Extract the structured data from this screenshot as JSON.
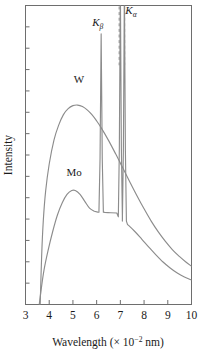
{
  "chart_data": {
    "type": "line",
    "title": "",
    "subtitle": "",
    "xlabel_parts": {
      "main": "Wavelength (× 10",
      "exponent": "−2",
      "tail": " nm)"
    },
    "xlabel": "Wavelength (× 10−2 nm)",
    "ylabel": "Intensity",
    "xlim": [
      3,
      10
    ],
    "ylim": [
      0,
      1
    ],
    "xticks": [
      3,
      4,
      5,
      6,
      7,
      8,
      9,
      10
    ],
    "xticklabels": [
      "3",
      "4",
      "5",
      "6",
      "7",
      "8",
      "9",
      "10"
    ],
    "yticks_count": 14,
    "yticklabels": [],
    "grid": false,
    "legend_position": "inline-annotations",
    "annotations": [
      {
        "id": "k-beta",
        "text_main": "K",
        "text_sub": "β",
        "x": 6.05,
        "y": 0.93
      },
      {
        "id": "k-alpha",
        "text_main": "K",
        "text_sub": "α",
        "x": 7.45,
        "y": 0.97
      },
      {
        "id": "w-label",
        "text_main": "W",
        "text_sub": "",
        "x": 5.25,
        "y": 0.74
      },
      {
        "id": "mo-label",
        "text_main": "Mo",
        "text_sub": "",
        "x": 5.05,
        "y": 0.43
      }
    ],
    "reference_lines": [
      {
        "id": "k-alpha-dash-left",
        "x": 6.95,
        "style": "dashed"
      },
      {
        "id": "k-alpha-dash-right",
        "x": 7.18,
        "style": "dashed"
      }
    ],
    "series": [
      {
        "name": "W",
        "label": "W",
        "color": "#8c8c8c",
        "cutoff_wavelength": 3.62,
        "peak_wavelength": 5.2,
        "peak_intensity": 0.67,
        "has_characteristic_peaks": false,
        "points": [
          [
            3.62,
            0.0
          ],
          [
            3.68,
            0.16
          ],
          [
            3.75,
            0.28
          ],
          [
            3.85,
            0.38
          ],
          [
            4.0,
            0.47
          ],
          [
            4.2,
            0.55
          ],
          [
            4.4,
            0.6
          ],
          [
            4.6,
            0.635
          ],
          [
            4.8,
            0.655
          ],
          [
            5.0,
            0.665
          ],
          [
            5.2,
            0.667
          ],
          [
            5.4,
            0.662
          ],
          [
            5.6,
            0.651
          ],
          [
            5.8,
            0.635
          ],
          [
            6.0,
            0.614
          ],
          [
            6.2,
            0.59
          ],
          [
            6.5,
            0.549
          ],
          [
            6.8,
            0.504
          ],
          [
            7.1,
            0.457
          ],
          [
            7.4,
            0.41
          ],
          [
            7.7,
            0.364
          ],
          [
            8.0,
            0.32
          ],
          [
            8.3,
            0.279
          ],
          [
            8.6,
            0.243
          ],
          [
            8.9,
            0.211
          ],
          [
            9.2,
            0.183
          ],
          [
            9.5,
            0.16
          ],
          [
            9.75,
            0.143
          ],
          [
            10.0,
            0.128
          ]
        ]
      },
      {
        "name": "Mo",
        "label": "Mo",
        "color": "#8c8c8c",
        "cutoff_wavelength": 3.58,
        "broad_hump_wavelength": 5.0,
        "broad_hump_intensity": 0.385,
        "has_characteristic_peaks": true,
        "characteristic_peaks": [
          {
            "name": "K-beta",
            "wavelength": 6.19,
            "intensity": 0.905,
            "halfwidth": 0.055
          },
          {
            "name": "K-alpha-1",
            "wavelength": 7.0,
            "intensity": 1.06,
            "halfwidth": 0.05
          },
          {
            "name": "K-alpha-2",
            "wavelength": 7.17,
            "intensity": 1.06,
            "halfwidth": 0.05
          }
        ],
        "points": [
          [
            3.58,
            0.0
          ],
          [
            3.66,
            0.05
          ],
          [
            3.78,
            0.115
          ],
          [
            3.95,
            0.18
          ],
          [
            4.15,
            0.245
          ],
          [
            4.35,
            0.3
          ],
          [
            4.55,
            0.34
          ],
          [
            4.75,
            0.368
          ],
          [
            4.95,
            0.381
          ],
          [
            5.1,
            0.381
          ],
          [
            5.3,
            0.368
          ],
          [
            5.5,
            0.345
          ],
          [
            5.7,
            0.322
          ],
          [
            5.9,
            0.312
          ],
          [
            6.05,
            0.309
          ],
          [
            6.35,
            0.308
          ],
          [
            6.6,
            0.307
          ],
          [
            6.85,
            0.306
          ],
          [
            7.3,
            0.268
          ],
          [
            7.6,
            0.245
          ],
          [
            7.9,
            0.219
          ],
          [
            8.2,
            0.192
          ],
          [
            8.5,
            0.166
          ],
          [
            8.8,
            0.142
          ],
          [
            9.1,
            0.122
          ],
          [
            9.4,
            0.105
          ],
          [
            9.7,
            0.092
          ],
          [
            10.0,
            0.082
          ]
        ]
      }
    ]
  },
  "figure": {
    "frame_color": "#6e6e6e",
    "background": "#ffffff"
  }
}
